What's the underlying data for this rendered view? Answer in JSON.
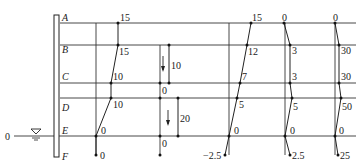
{
  "rows": [
    {
      "label": "A",
      "y": 23
    },
    {
      "label": "B",
      "y": 45
    },
    {
      "label": "C",
      "y": 83
    },
    {
      "label": "D",
      "y": 98
    },
    {
      "label": "E",
      "y": 136
    },
    {
      "label": "F",
      "y": 155
    }
  ],
  "water_level": {
    "label": "0",
    "symbol": "water-table-triangle"
  },
  "diagrams": [
    {
      "name": "diagram-1",
      "baseline_x": 96,
      "points": [
        {
          "row": "A",
          "value": "15"
        },
        {
          "row": "B",
          "value": "15"
        },
        {
          "row": "C",
          "value": "10"
        },
        {
          "row": "D",
          "value": "10"
        },
        {
          "row": "E",
          "value": "0"
        },
        {
          "row": "F",
          "value": "0"
        }
      ]
    },
    {
      "name": "diagram-2",
      "baseline_x": 160,
      "segments": [
        {
          "from_row": "B",
          "to_row": "C",
          "value": "10",
          "top_label": "",
          "bottom_label": "0",
          "arrow": "down"
        },
        {
          "from_row": "D",
          "to_row": "E",
          "value": "20",
          "top_label": "",
          "bottom_label": "0",
          "arrow": "down"
        }
      ],
      "f_point": {
        "row": "F",
        "value": ""
      }
    },
    {
      "name": "diagram-3",
      "baseline_x": 229,
      "points": [
        {
          "row": "A",
          "value": "15"
        },
        {
          "row": "B",
          "value": "12"
        },
        {
          "row": "C",
          "value": "7"
        },
        {
          "row": "D",
          "value": "5"
        },
        {
          "row": "E",
          "value": "0"
        },
        {
          "row": "F",
          "value": "−2.5"
        }
      ]
    },
    {
      "name": "diagram-4",
      "baseline_x": 285,
      "points": [
        {
          "row": "A",
          "value": "0"
        },
        {
          "row": "B",
          "value": "3"
        },
        {
          "row": "C",
          "value": "3"
        },
        {
          "row": "D",
          "value": "5"
        },
        {
          "row": "E",
          "value": "0"
        },
        {
          "row": "F",
          "value": "2.5"
        }
      ]
    },
    {
      "name": "diagram-5",
      "baseline_x": 335,
      "points": [
        {
          "row": "A",
          "value": "0"
        },
        {
          "row": "B",
          "value": "30"
        },
        {
          "row": "C",
          "value": "30"
        },
        {
          "row": "D",
          "value": "50"
        },
        {
          "row": "E",
          "value": "0"
        },
        {
          "row": "F",
          "value": "25"
        }
      ]
    }
  ]
}
